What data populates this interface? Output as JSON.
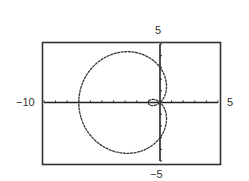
{
  "chart_data": {
    "type": "line",
    "title": "",
    "equation": "r = 3 - 4cos(theta)",
    "params": {
      "a": 3,
      "b": 4
    },
    "theta_range": [
      0,
      6.283185307
    ],
    "xlim": [
      -10,
      5
    ],
    "ylim": [
      -5,
      5
    ],
    "xlabel": "",
    "ylabel": "",
    "grid": false,
    "axis_ticks": {
      "x_step": 1,
      "y_step": 1
    },
    "tick_labels": {
      "x_min": "−10",
      "x_max": "5",
      "y_max": "5",
      "y_min": "−5"
    },
    "key_points": [
      {
        "theta": "0",
        "x": -1,
        "y": 0
      },
      {
        "theta": "pi/2",
        "x": 0,
        "y": 3
      },
      {
        "theta": "pi",
        "x": -7,
        "y": 0
      },
      {
        "theta": "3pi/2",
        "x": 0,
        "y": -3
      }
    ]
  },
  "colors": {
    "curve": "#333333",
    "axes": "#222222",
    "frame": "#333333",
    "background": "#ffffff"
  }
}
